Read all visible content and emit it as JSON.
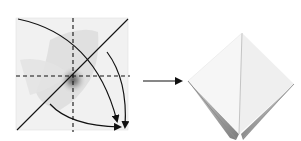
{
  "diagram": {
    "type": "origami-fold-instruction",
    "steps": [
      {
        "id": "step-1",
        "description": "Square sheet with horizontal and vertical dashed valley folds, diagonal crease line, and two curved arrows folding corners down to bottom-right",
        "fold_lines": {
          "dashed": [
            "vertical-center",
            "horizontal-center"
          ],
          "solid": [
            "diagonal-bottom-left-to-top-right"
          ]
        },
        "arrows": [
          "curved-arrow-top-left-to-bottom-right",
          "curved-arrow-right-down",
          "curved-arrow-bottom-left-to-bottom-right"
        ]
      },
      {
        "id": "step-2",
        "description": "Resulting folded diamond / preliminary base shape with shaded underside"
      }
    ],
    "transition_arrow": "right-arrow"
  },
  "colors": {
    "ink": "#111111",
    "paper": "#f4f4f4",
    "paper_shade": "#d8d8d8",
    "shadow": "#8a8a8a",
    "background": "#ffffff"
  }
}
